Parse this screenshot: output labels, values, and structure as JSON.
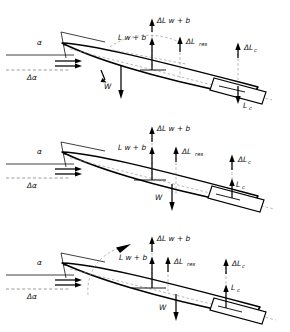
{
  "figure": {
    "type": "engineering-schematic",
    "background_color": "#ffffff",
    "ink_color": "#000000",
    "panel_count": 3
  },
  "labels": {
    "alpha": "α",
    "delta_alpha": "Δα",
    "delta_L_wb": "ΔL w + b",
    "L_wb": "L w + b",
    "delta_L_res": "ΔL",
    "delta_L_res_sub": "res",
    "delta_L_c": "ΔL",
    "delta_L_c_sub": "c",
    "L_c": "L",
    "L_c_sub": "c",
    "weight": "W"
  },
  "panels": [
    {
      "id": "panel-top",
      "name": "configuration-a",
      "canard_lift_direction": "down",
      "has_rotation_arc": true,
      "forces": [
        "ΔL w + b",
        "L w + b",
        "ΔL res",
        "ΔL c",
        "L c",
        "W"
      ]
    },
    {
      "id": "panel-middle",
      "name": "configuration-b",
      "canard_lift_direction": "up",
      "has_rotation_arc": false,
      "forces": [
        "ΔL w + b",
        "L w + b",
        "ΔL res",
        "ΔL c",
        "L c",
        "W"
      ]
    },
    {
      "id": "panel-bottom",
      "name": "configuration-c",
      "canard_lift_direction": "up",
      "has_rotation_arc": true,
      "forces": [
        "ΔL w + b",
        "L w + b",
        "ΔL res",
        "ΔL c",
        "L c",
        "W"
      ]
    }
  ]
}
